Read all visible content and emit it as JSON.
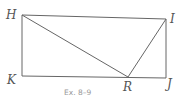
{
  "figure": {
    "caption": "Ex. 8–9",
    "points": {
      "H": {
        "label": "H",
        "x": 22,
        "y": 15
      },
      "I": {
        "label": "I",
        "x": 166,
        "y": 19
      },
      "J": {
        "label": "J",
        "x": 166,
        "y": 78
      },
      "K": {
        "label": "K",
        "x": 22,
        "y": 76
      },
      "R": {
        "label": "R",
        "x": 128,
        "y": 77
      }
    },
    "segments": [
      "HI",
      "IJ",
      "JK",
      "KH",
      "HR",
      "RI"
    ],
    "colors": {
      "line": "#666666",
      "label": "#555555",
      "caption": "#999999"
    }
  }
}
